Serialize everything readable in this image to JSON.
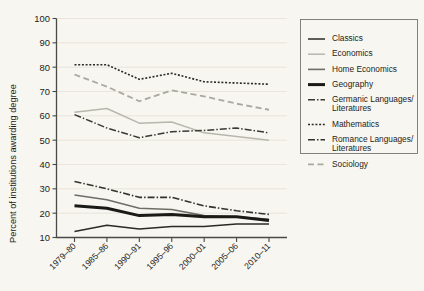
{
  "chart_data": {
    "type": "line",
    "title": "",
    "xlabel": "",
    "ylabel": "Percent of institutions awarding degree",
    "categories": [
      "1979–80",
      "1985–86",
      "1990–91",
      "1995–96",
      "2000–01",
      "2005–06",
      "2010–11"
    ],
    "ylim": [
      10,
      100
    ],
    "ytick_labels": [
      "10",
      "20",
      "30",
      "40",
      "50",
      "60",
      "70",
      "80",
      "90",
      "100"
    ],
    "ytick_values": [
      10,
      20,
      30,
      40,
      50,
      60,
      70,
      80,
      90,
      100
    ],
    "grid": true,
    "legend_position": "right",
    "series": [
      {
        "name": "Classics",
        "values": [
          12.5,
          15.0,
          13.5,
          14.5,
          14.5,
          15.5,
          15.5
        ],
        "color": "#2b2a26",
        "width": 1.5,
        "dash": "none"
      },
      {
        "name": "Economics",
        "values": [
          61.5,
          63.0,
          57.0,
          57.5,
          53.0,
          51.5,
          50.0
        ],
        "color": "#b8b7ad",
        "width": 1.5,
        "dash": "none"
      },
      {
        "name": "Home Economics",
        "values": [
          27.5,
          25.5,
          22.0,
          21.5,
          19.0,
          18.5,
          17.5
        ],
        "color": "#6e6d66",
        "width": 1.6,
        "dash": "none"
      },
      {
        "name": "Geography",
        "values": [
          23.0,
          22.0,
          19.0,
          19.5,
          18.5,
          18.5,
          17.0
        ],
        "color": "#1a1a17",
        "width": 3.0,
        "dash": "none"
      },
      {
        "name": "Germanic Languages/\nLiteratures",
        "values": [
          60.5,
          55.0,
          51.0,
          53.5,
          54.0,
          55.0,
          53.0
        ],
        "color": "#3a3933",
        "width": 1.5,
        "dash": "7,2,1.5,2"
      },
      {
        "name": "Mathematics",
        "values": [
          81.0,
          81.0,
          75.0,
          77.5,
          74.0,
          73.5,
          73.0
        ],
        "color": "#2b2a26",
        "width": 1.6,
        "dash": "2,1.7"
      },
      {
        "name": "Romance Languages/\nLiteratures",
        "values": [
          33.0,
          30.0,
          26.5,
          26.5,
          23.0,
          21.0,
          19.5
        ],
        "color": "#33322d",
        "width": 1.6,
        "dash": "7,2,1.5,2"
      },
      {
        "name": "Sociology",
        "values": [
          77.0,
          72.0,
          66.0,
          70.5,
          68.0,
          65.0,
          62.5
        ],
        "color": "#aaa99f",
        "width": 1.8,
        "dash": "6,3.5"
      }
    ]
  },
  "legend": {
    "entries": [
      {
        "label": "Classics"
      },
      {
        "label": "Economics"
      },
      {
        "label": "Home Economics"
      },
      {
        "label": "Geography"
      },
      {
        "label": "Germanic Languages/",
        "label2": "Literatures"
      },
      {
        "label": "Mathematics"
      },
      {
        "label": "Romance Languages/",
        "label2": "Literatures"
      },
      {
        "label": "Sociology"
      }
    ]
  },
  "colors": {
    "background": "#f7f6f0",
    "axis": "#4a4a46",
    "grid": "#e3e1d7",
    "text": "#1d1d1b"
  }
}
